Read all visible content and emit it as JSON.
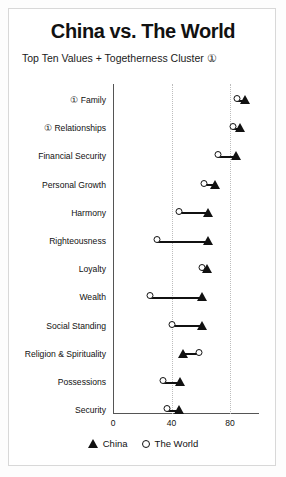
{
  "title": "China vs. The World",
  "subtitle": "Top Ten Values + Togetherness Cluster ①",
  "legend": {
    "china_label": "China",
    "world_label": "The World",
    "china_marker": "triangle-marker-icon",
    "world_marker": "circle-marker-icon"
  },
  "axis": {
    "ticks": [
      "0",
      "40",
      "80"
    ],
    "tick_values": [
      0,
      40,
      80
    ]
  },
  "chart_data": {
    "type": "scatter",
    "title": "China vs. The World",
    "subtitle": "Top Ten Values + Togetherness Cluster ①",
    "xlabel": "",
    "ylabel": "",
    "xlim": [
      0,
      100
    ],
    "grid": true,
    "gridlines_at": [
      40,
      80
    ],
    "legend_position": "bottom-center",
    "categories": [
      "① Family",
      "① Relationships",
      "Financial Security",
      "Personal Growth",
      "Harmony",
      "Righteousness",
      "Loyalty",
      "Wealth",
      "Social Standing",
      "Religion & Spirituality",
      "Possessions",
      "Security"
    ],
    "series": [
      {
        "name": "China",
        "marker": "triangle",
        "values": [
          90,
          87,
          84,
          70,
          65,
          65,
          64,
          61,
          61,
          48,
          46,
          45
        ]
      },
      {
        "name": "The World",
        "marker": "circle",
        "values": [
          85,
          82,
          72,
          62,
          45,
          30,
          61,
          25,
          40,
          59,
          34,
          37
        ]
      }
    ]
  }
}
